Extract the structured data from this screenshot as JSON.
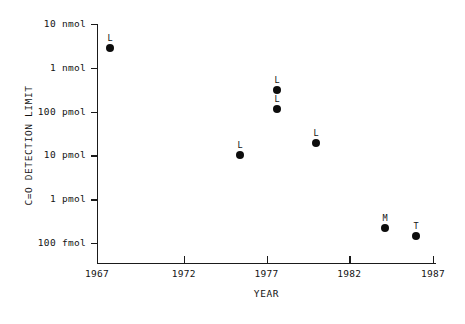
{
  "chart_data": {
    "type": "scatter",
    "title": "",
    "xlabel": "YEAR",
    "ylabel": "C=O DETECTION LIMIT",
    "xlim": [
      1967,
      1987
    ],
    "ylim_log_labels": [
      "100 fmol",
      "1 pmol",
      "10 pmol",
      "100 pmol",
      "1 nmol",
      "10 nmol"
    ],
    "yscale": "log",
    "grid": false,
    "legend": null,
    "x_ticks": [
      {
        "value": 1967,
        "label": "1967",
        "px": 97
      },
      {
        "value": 1972,
        "label": "1972",
        "px": 183.75
      },
      {
        "value": 1977,
        "label": "1977",
        "px": 266.5
      },
      {
        "value": 1982,
        "label": "1982",
        "px": 349.25
      },
      {
        "value": 1987,
        "label": "1987",
        "px": 433
      }
    ],
    "y_ticks": [
      {
        "label": "10 nmol",
        "value_pmol": 10000,
        "px": 24
      },
      {
        "label": "1 nmol",
        "value_pmol": 1000,
        "px": 67.8
      },
      {
        "label": "100 pmol",
        "value_pmol": 100,
        "px": 111.6
      },
      {
        "label": "10 pmol",
        "value_pmol": 10,
        "px": 155.4
      },
      {
        "label": "1 pmol",
        "value_pmol": 1,
        "px": 199.2
      },
      {
        "label": "100 fmol",
        "value_pmol": 0.1,
        "px": 243
      }
    ],
    "points": [
      {
        "label": "L",
        "year": 1968.2,
        "value_pmol": 3000,
        "px": 110,
        "py": 48
      },
      {
        "label": "L",
        "year": 1978.0,
        "value_pmol": 420,
        "px": 277,
        "py": 90
      },
      {
        "label": "L",
        "year": 1978.0,
        "value_pmol": 155,
        "px": 277,
        "py": 109
      },
      {
        "label": "L",
        "year": 1977.2,
        "value_pmol": 20,
        "px": 240,
        "py": 155
      },
      {
        "label": "L",
        "year": 1979.5,
        "value_pmol": 42,
        "px": 316,
        "py": 143
      },
      {
        "label": "M",
        "year": 1984.0,
        "value_pmol": 0.78,
        "px": 385,
        "py": 228
      },
      {
        "label": "T",
        "year": 1985.8,
        "value_pmol": 0.52,
        "px": 416,
        "py": 236
      }
    ]
  },
  "colors": {
    "axis": "#1a1a1a",
    "marker": "#0d0d0d",
    "text": "#131313",
    "background": "#ffffff"
  }
}
